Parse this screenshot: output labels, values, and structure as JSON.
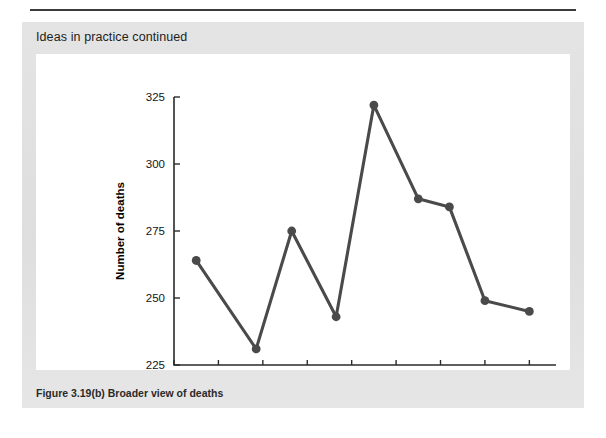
{
  "panel": {
    "title": "Ideas in practice continued",
    "caption": "Figure 3.19(b)  Broader view of deaths",
    "background_color": "#e2e2e2",
    "card_background": "#ffffff"
  },
  "chart_data": {
    "type": "line",
    "title": "",
    "subtitle": "",
    "xlabel": "Year",
    "ylabel": "Number of deaths",
    "xlim": [
      1951,
      1959.6
    ],
    "ylim": [
      225,
      325
    ],
    "xticks": [
      1951,
      1952,
      1953,
      1954,
      1955,
      1956,
      1957,
      1958,
      1959
    ],
    "xtick_labels": [
      "1951",
      "",
      "1953",
      "",
      "1955",
      "",
      "1957",
      "",
      "1959"
    ],
    "yticks": [
      225,
      250,
      275,
      300,
      325
    ],
    "ytick_labels": [
      "225",
      "250",
      "275",
      "300",
      "325"
    ],
    "grid": false,
    "legend": "none",
    "marker": "circle",
    "line_color": "#4a4a4a",
    "marker_color": "#4a4a4a",
    "x": [
      1951.5,
      1952.85,
      1953.65,
      1954.65,
      1955.5,
      1956.5,
      1957.2,
      1958.0,
      1959.0
    ],
    "values": [
      264,
      231,
      275,
      243,
      322,
      287,
      284,
      249,
      245
    ],
    "points": [
      {
        "x": 1951.5,
        "y": 264
      },
      {
        "x": 1952.85,
        "y": 231
      },
      {
        "x": 1953.65,
        "y": 275
      },
      {
        "x": 1954.65,
        "y": 243
      },
      {
        "x": 1955.5,
        "y": 322
      },
      {
        "x": 1956.5,
        "y": 287
      },
      {
        "x": 1957.2,
        "y": 284
      },
      {
        "x": 1958.0,
        "y": 249
      },
      {
        "x": 1959.0,
        "y": 245
      }
    ]
  }
}
